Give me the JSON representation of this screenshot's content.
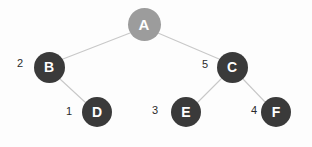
{
  "figure": {
    "type": "binary-tree-diagram",
    "background_color": "#fdfdfd",
    "edge_color": "#c8c8c8",
    "node_dark_color": "#3a3a3a",
    "node_root_color": "#9c9c9c",
    "node_text_color": "#ffffff",
    "weight_text_color": "#2b2b2b"
  },
  "nodes": [
    {
      "id": "A",
      "label": "A",
      "cx": 144,
      "cy": 24,
      "r": 16.5,
      "fill": "#9c9c9c",
      "font_size": 15
    },
    {
      "id": "B",
      "label": "B",
      "cx": 49,
      "cy": 67,
      "r": 15.5,
      "fill": "#3a3a3a",
      "font_size": 14
    },
    {
      "id": "C",
      "label": "C",
      "cx": 232,
      "cy": 67,
      "r": 15.5,
      "fill": "#3a3a3a",
      "font_size": 14
    },
    {
      "id": "D",
      "label": "D",
      "cx": 97,
      "cy": 112,
      "r": 15.0,
      "fill": "#3a3a3a",
      "font_size": 14
    },
    {
      "id": "E",
      "label": "E",
      "cx": 186,
      "cy": 112,
      "r": 15.0,
      "fill": "#3a3a3a",
      "font_size": 14
    },
    {
      "id": "F",
      "label": "F",
      "cx": 276,
      "cy": 112,
      "r": 15.0,
      "fill": "#3a3a3a",
      "font_size": 14
    }
  ],
  "edges": [
    {
      "from": "A",
      "to": "B",
      "x1": 130,
      "y1": 33,
      "x2": 63,
      "y2": 59,
      "weight": ""
    },
    {
      "from": "A",
      "to": "C",
      "x1": 158,
      "y1": 33,
      "x2": 219,
      "y2": 59,
      "weight": ""
    },
    {
      "from": "B",
      "to": "D",
      "x1": 60,
      "y1": 79,
      "x2": 86,
      "y2": 103,
      "weight": ""
    },
    {
      "from": "C",
      "to": "E",
      "x1": 221,
      "y1": 79,
      "x2": 197,
      "y2": 103,
      "weight": ""
    },
    {
      "from": "C",
      "to": "F",
      "x1": 243,
      "y1": 79,
      "x2": 266,
      "y2": 103,
      "weight": ""
    }
  ],
  "weights": [
    {
      "id": "weight-b",
      "node": "B",
      "value": "2",
      "x": 17,
      "y": 58
    },
    {
      "id": "weight-c",
      "node": "C",
      "value": "5",
      "x": 202,
      "y": 59
    },
    {
      "id": "weight-d",
      "node": "D",
      "value": "1",
      "x": 66,
      "y": 106
    },
    {
      "id": "weight-e",
      "node": "E",
      "value": "3",
      "x": 152,
      "y": 105
    },
    {
      "id": "weight-f",
      "node": "F",
      "value": "4",
      "x": 251,
      "y": 105
    }
  ]
}
